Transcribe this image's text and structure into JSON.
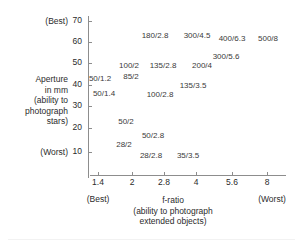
{
  "chart_data": {
    "type": "scatter",
    "title": "",
    "xlabel": "f-ratio",
    "xlabel_sub": "(ability to photograph extended objects)",
    "ylabel_lines": [
      "Aperture",
      "in mm",
      "(ability to",
      "photograph",
      "stars)"
    ],
    "x_ticks": [
      "1.4",
      "2",
      "2.8",
      "4",
      "5.6",
      "8"
    ],
    "x_tick_values": [
      1.4,
      2,
      2.8,
      4,
      5.6,
      8
    ],
    "y_ticks": [
      "70",
      "60",
      "50",
      "40",
      "30",
      "20",
      "10"
    ],
    "y_tick_values": [
      70,
      60,
      50,
      40,
      30,
      20,
      10
    ],
    "xlim": [
      1.4,
      8
    ],
    "ylim": [
      0,
      75
    ],
    "x_scale": "log",
    "grid": false,
    "legend": false,
    "x_best_label": "(Best)",
    "x_worst_label": "(Worst)",
    "y_best_label": "(Best)",
    "y_worst_label": "(Worst)",
    "points": [
      {
        "label": "180/2.8",
        "focal_length": 180,
        "f_ratio": 2.8,
        "aperture_mm": 64
      },
      {
        "label": "300/4.5",
        "focal_length": 300,
        "f_ratio": 4.5,
        "aperture_mm": 67
      },
      {
        "label": "400/6.3",
        "focal_length": 400,
        "f_ratio": 6.3,
        "aperture_mm": 63
      },
      {
        "label": "500/8",
        "focal_length": 500,
        "f_ratio": 8,
        "aperture_mm": 63
      },
      {
        "label": "300/5.6",
        "focal_length": 300,
        "f_ratio": 5.6,
        "aperture_mm": 54
      },
      {
        "label": "100/2",
        "focal_length": 100,
        "f_ratio": 2,
        "aperture_mm": 50
      },
      {
        "label": "135/2.8",
        "focal_length": 135,
        "f_ratio": 2.8,
        "aperture_mm": 48
      },
      {
        "label": "200/4",
        "focal_length": 200,
        "f_ratio": 4,
        "aperture_mm": 50
      },
      {
        "label": "85/2",
        "focal_length": 85,
        "f_ratio": 2,
        "aperture_mm": 43
      },
      {
        "label": "50/1.2",
        "focal_length": 50,
        "f_ratio": 1.2,
        "aperture_mm": 42
      },
      {
        "label": "135/3.5",
        "focal_length": 135,
        "f_ratio": 3.5,
        "aperture_mm": 39
      },
      {
        "label": "50/1.4",
        "focal_length": 50,
        "f_ratio": 1.4,
        "aperture_mm": 36
      },
      {
        "label": "100/2.8",
        "focal_length": 100,
        "f_ratio": 2.8,
        "aperture_mm": 36
      },
      {
        "label": "50/2",
        "focal_length": 50,
        "f_ratio": 2,
        "aperture_mm": 25
      },
      {
        "label": "50/2.8",
        "focal_length": 50,
        "f_ratio": 2.8,
        "aperture_mm": 18
      },
      {
        "label": "28/2",
        "focal_length": 28,
        "f_ratio": 2,
        "aperture_mm": 14
      },
      {
        "label": "28/2.8",
        "focal_length": 28,
        "f_ratio": 2.8,
        "aperture_mm": 10
      },
      {
        "label": "35/3.5",
        "focal_length": 35,
        "f_ratio": 3.5,
        "aperture_mm": 10
      }
    ],
    "label_positions": [
      {
        "label": "180/2.8",
        "x": 155,
        "y": 31
      },
      {
        "label": "300/4.5",
        "x": 197,
        "y": 31
      },
      {
        "label": "400/6.3",
        "x": 232,
        "y": 34
      },
      {
        "label": "500/8",
        "x": 268,
        "y": 34
      },
      {
        "label": "300/5.6",
        "x": 226,
        "y": 52
      },
      {
        "label": "100/2",
        "x": 129,
        "y": 61
      },
      {
        "label": "135/2.8",
        "x": 163,
        "y": 61
      },
      {
        "label": "200/4",
        "x": 202,
        "y": 61
      },
      {
        "label": "85/2",
        "x": 131,
        "y": 72
      },
      {
        "label": "50/1.2",
        "x": 100,
        "y": 74
      },
      {
        "label": "135/3.5",
        "x": 193,
        "y": 81
      },
      {
        "label": "50/1.4",
        "x": 104,
        "y": 89
      },
      {
        "label": "100/2.8",
        "x": 160,
        "y": 90
      },
      {
        "label": "50/2",
        "x": 126,
        "y": 117
      },
      {
        "label": "50/2.8",
        "x": 153,
        "y": 131
      },
      {
        "label": "28/2",
        "x": 124,
        "y": 140
      },
      {
        "label": "28/2.8",
        "x": 151,
        "y": 151
      },
      {
        "label": "35/3.5",
        "x": 188,
        "y": 151
      }
    ],
    "y_tick_pixel_y": [
      21,
      42,
      63,
      85,
      106,
      128,
      152
    ],
    "x_tick_pixel_x": [
      98,
      132,
      164,
      196,
      232,
      267
    ]
  }
}
